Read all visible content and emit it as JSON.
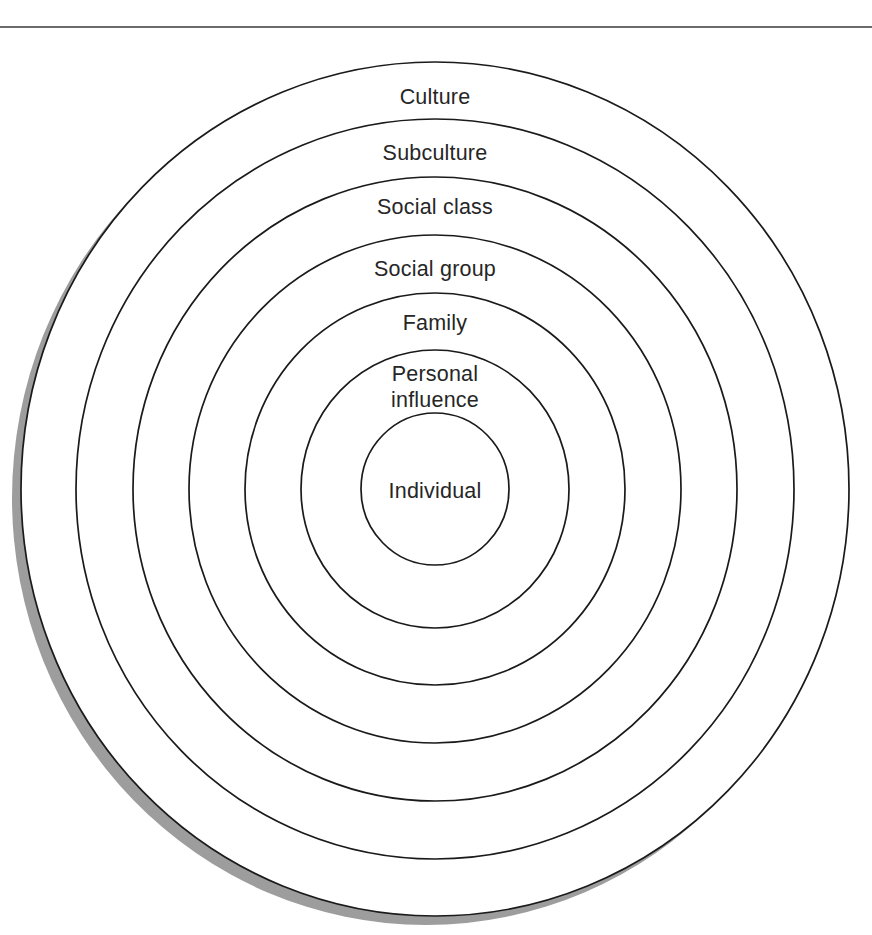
{
  "page": {
    "background_color": "#ffffff",
    "width": 872,
    "height": 935
  },
  "top_rule": {
    "name": "horizontal-rule",
    "color": "#3a3a3a",
    "y": 27
  },
  "diagram": {
    "type": "concentric-circles",
    "stroke_color": "#1a1a1a",
    "fill_color": "#ffffff",
    "shadow_color": "#9d9d9d",
    "label_color": "#262626",
    "center": {
      "x": 435,
      "y": 489
    },
    "rings": [
      {
        "id": "culture",
        "label": "Culture",
        "level": 1,
        "rx": 414,
        "ry": 427,
        "label_x": 435,
        "label_y": 84
      },
      {
        "id": "subculture",
        "label": "Subculture",
        "level": 2,
        "rx": 359,
        "ry": 370,
        "label_x": 435,
        "label_y": 140
      },
      {
        "id": "social-class",
        "label": "Social class",
        "level": 3,
        "rx": 302,
        "ry": 312,
        "label_x": 435,
        "label_y": 194
      },
      {
        "id": "social-group",
        "label": "Social group",
        "level": 4,
        "rx": 246,
        "ry": 254,
        "label_x": 435,
        "label_y": 256
      },
      {
        "id": "family",
        "label": "Family",
        "level": 5,
        "rx": 190,
        "ry": 196,
        "label_x": 435,
        "label_y": 310
      },
      {
        "id": "personal-influence",
        "label": "Personal\ninfluence",
        "level": 6,
        "rx": 134,
        "ry": 139,
        "label_x": 435,
        "label_y": 361
      },
      {
        "id": "individual",
        "label": "Individual",
        "level": 7,
        "rx": 74,
        "ry": 76,
        "label_x": 435,
        "label_y": 478
      }
    ]
  }
}
